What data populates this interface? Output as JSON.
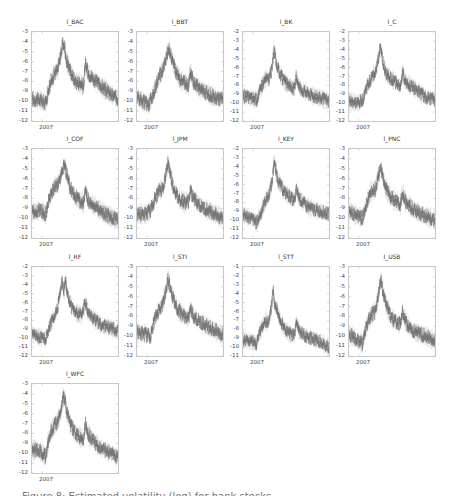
{
  "figure": {
    "caption": "Figure 8: Estimated volatility (log) for bank stocks"
  },
  "chart_data": [
    {
      "type": "line",
      "title": "l_BAC",
      "xlabel": "",
      "ylabel": "",
      "x_tick_labels": [
        "2007"
      ],
      "yticks": [
        -3,
        -4,
        -5,
        -6,
        -7,
        -8,
        -9,
        -10,
        -11,
        -12
      ],
      "ylim": [
        -12,
        -3
      ],
      "keypoints": [
        [
          0,
          -9.8
        ],
        [
          0.1,
          -9.9
        ],
        [
          0.16,
          -10.2
        ],
        [
          0.2,
          -8.5
        ],
        [
          0.26,
          -7.2
        ],
        [
          0.3,
          -6.8
        ],
        [
          0.34,
          -5
        ],
        [
          0.36,
          -4.1
        ],
        [
          0.38,
          -4.6
        ],
        [
          0.4,
          -5.8
        ],
        [
          0.44,
          -6.8
        ],
        [
          0.5,
          -8
        ],
        [
          0.56,
          -8.2
        ],
        [
          0.6,
          -8.5
        ],
        [
          0.62,
          -6.3
        ],
        [
          0.66,
          -7.2
        ],
        [
          0.74,
          -8
        ],
        [
          0.82,
          -8.6
        ],
        [
          0.9,
          -9.2
        ],
        [
          1,
          -9.8
        ]
      ]
    },
    {
      "type": "line",
      "title": "l_BBT",
      "xlabel": "",
      "ylabel": "",
      "x_tick_labels": [
        "2007"
      ],
      "yticks": [
        -3,
        -4,
        -5,
        -6,
        -7,
        -8,
        -9,
        -10,
        -11,
        -12
      ],
      "ylim": [
        -12,
        -3
      ],
      "keypoints": [
        [
          0,
          -9.6
        ],
        [
          0.1,
          -10.2
        ],
        [
          0.14,
          -10.3
        ],
        [
          0.2,
          -9
        ],
        [
          0.26,
          -7.5
        ],
        [
          0.3,
          -6.8
        ],
        [
          0.34,
          -5.5
        ],
        [
          0.37,
          -4.6
        ],
        [
          0.4,
          -5.5
        ],
        [
          0.44,
          -6.8
        ],
        [
          0.5,
          -7.8
        ],
        [
          0.56,
          -8.2
        ],
        [
          0.6,
          -8.4
        ],
        [
          0.62,
          -7
        ],
        [
          0.66,
          -8.2
        ],
        [
          0.74,
          -8.8
        ],
        [
          0.82,
          -9.2
        ],
        [
          0.9,
          -9.6
        ],
        [
          1,
          -9.9
        ]
      ]
    },
    {
      "type": "line",
      "title": "l_BK",
      "xlabel": "",
      "ylabel": "",
      "x_tick_labels": [
        "2007"
      ],
      "yticks": [
        -2,
        -3,
        -4,
        -5,
        -6,
        -7,
        -8,
        -9,
        -10,
        -11,
        -12
      ],
      "ylim": [
        -12,
        -2
      ],
      "keypoints": [
        [
          0,
          -9.2
        ],
        [
          0.1,
          -9.4
        ],
        [
          0.16,
          -9.6
        ],
        [
          0.2,
          -8.5
        ],
        [
          0.26,
          -7.2
        ],
        [
          0.3,
          -7.3
        ],
        [
          0.34,
          -6
        ],
        [
          0.36,
          -3.8
        ],
        [
          0.38,
          -5.2
        ],
        [
          0.42,
          -6.5
        ],
        [
          0.48,
          -7.6
        ],
        [
          0.56,
          -8.2
        ],
        [
          0.6,
          -8.4
        ],
        [
          0.62,
          -7
        ],
        [
          0.66,
          -8.3
        ],
        [
          0.74,
          -8.8
        ],
        [
          0.82,
          -9.2
        ],
        [
          0.9,
          -9.4
        ],
        [
          1,
          -9.8
        ]
      ]
    },
    {
      "type": "line",
      "title": "l_C",
      "xlabel": "",
      "ylabel": "",
      "x_tick_labels": [
        "2007"
      ],
      "yticks": [
        -2,
        -3,
        -4,
        -5,
        -6,
        -7,
        -8,
        -9,
        -10,
        -11,
        -12
      ],
      "ylim": [
        -12,
        -2
      ],
      "keypoints": [
        [
          0,
          -9.8
        ],
        [
          0.1,
          -10
        ],
        [
          0.16,
          -9.6
        ],
        [
          0.2,
          -8.3
        ],
        [
          0.26,
          -7.2
        ],
        [
          0.3,
          -6.6
        ],
        [
          0.34,
          -5.2
        ],
        [
          0.36,
          -3.8
        ],
        [
          0.39,
          -5
        ],
        [
          0.42,
          -6.5
        ],
        [
          0.48,
          -7.2
        ],
        [
          0.56,
          -7.8
        ],
        [
          0.6,
          -8.2
        ],
        [
          0.62,
          -6.6
        ],
        [
          0.66,
          -7.6
        ],
        [
          0.74,
          -8.2
        ],
        [
          0.82,
          -8.8
        ],
        [
          0.9,
          -9.4
        ],
        [
          1,
          -9.6
        ]
      ]
    },
    {
      "type": "line",
      "title": "l_COF",
      "xlabel": "",
      "ylabel": "",
      "x_tick_labels": [
        "2007"
      ],
      "yticks": [
        -3,
        -4,
        -5,
        -6,
        -7,
        -8,
        -9,
        -10,
        -11,
        -12
      ],
      "ylim": [
        -12,
        -3
      ],
      "keypoints": [
        [
          0,
          -9.4
        ],
        [
          0.1,
          -9.2
        ],
        [
          0.16,
          -9.6
        ],
        [
          0.2,
          -8
        ],
        [
          0.26,
          -6.8
        ],
        [
          0.3,
          -6.6
        ],
        [
          0.34,
          -5.5
        ],
        [
          0.37,
          -4.6
        ],
        [
          0.4,
          -5.4
        ],
        [
          0.44,
          -6.8
        ],
        [
          0.5,
          -7.8
        ],
        [
          0.56,
          -8.3
        ],
        [
          0.6,
          -8.5
        ],
        [
          0.62,
          -7.2
        ],
        [
          0.66,
          -8.3
        ],
        [
          0.74,
          -8.8
        ],
        [
          0.82,
          -9.4
        ],
        [
          0.9,
          -9.8
        ],
        [
          1,
          -10.2
        ]
      ]
    },
    {
      "type": "line",
      "title": "l_JPM",
      "xlabel": "",
      "ylabel": "",
      "x_tick_labels": [
        "2007"
      ],
      "yticks": [
        -3,
        -4,
        -5,
        -6,
        -7,
        -8,
        -9,
        -10,
        -11,
        -12
      ],
      "ylim": [
        -12,
        -3
      ],
      "keypoints": [
        [
          0,
          -9.6
        ],
        [
          0.1,
          -9.6
        ],
        [
          0.16,
          -9.2
        ],
        [
          0.2,
          -8.2
        ],
        [
          0.26,
          -7.2
        ],
        [
          0.3,
          -7
        ],
        [
          0.34,
          -5.5
        ],
        [
          0.36,
          -4.3
        ],
        [
          0.39,
          -5.6
        ],
        [
          0.42,
          -6.8
        ],
        [
          0.48,
          -8
        ],
        [
          0.56,
          -8.4
        ],
        [
          0.6,
          -8.3
        ],
        [
          0.62,
          -7.2
        ],
        [
          0.66,
          -8
        ],
        [
          0.74,
          -8.8
        ],
        [
          0.82,
          -9.2
        ],
        [
          0.9,
          -9.5
        ],
        [
          1,
          -10
        ]
      ]
    },
    {
      "type": "line",
      "title": "l_KEY",
      "xlabel": "",
      "ylabel": "",
      "x_tick_labels": [
        "2007"
      ],
      "yticks": [
        -2,
        -3,
        -4,
        -5,
        -6,
        -7,
        -8,
        -9,
        -10,
        -11,
        -12
      ],
      "ylim": [
        -12,
        -2
      ],
      "keypoints": [
        [
          0,
          -9.4
        ],
        [
          0.1,
          -9.8
        ],
        [
          0.16,
          -10.3
        ],
        [
          0.2,
          -9.4
        ],
        [
          0.26,
          -7.8
        ],
        [
          0.3,
          -7.2
        ],
        [
          0.34,
          -5.6
        ],
        [
          0.36,
          -3.4
        ],
        [
          0.39,
          -4.8
        ],
        [
          0.42,
          -5.8
        ],
        [
          0.48,
          -6.8
        ],
        [
          0.56,
          -7.5
        ],
        [
          0.6,
          -7.9
        ],
        [
          0.62,
          -6.6
        ],
        [
          0.66,
          -7.6
        ],
        [
          0.74,
          -8.4
        ],
        [
          0.82,
          -8.8
        ],
        [
          0.9,
          -9
        ],
        [
          1,
          -9.3
        ]
      ]
    },
    {
      "type": "line",
      "title": "l_PNC",
      "xlabel": "",
      "ylabel": "",
      "x_tick_labels": [
        "2007"
      ],
      "yticks": [
        -3,
        -4,
        -5,
        -6,
        -7,
        -8,
        -9,
        -10,
        -11,
        -12
      ],
      "ylim": [
        -12,
        -3
      ],
      "keypoints": [
        [
          0,
          -9.2
        ],
        [
          0.1,
          -9.8
        ],
        [
          0.16,
          -10
        ],
        [
          0.2,
          -8.6
        ],
        [
          0.26,
          -7.2
        ],
        [
          0.3,
          -7.2
        ],
        [
          0.34,
          -5.8
        ],
        [
          0.37,
          -4.9
        ],
        [
          0.4,
          -6
        ],
        [
          0.44,
          -7.2
        ],
        [
          0.5,
          -8
        ],
        [
          0.56,
          -8.4
        ],
        [
          0.6,
          -8.6
        ],
        [
          0.62,
          -7.3
        ],
        [
          0.66,
          -8.4
        ],
        [
          0.74,
          -9
        ],
        [
          0.82,
          -9.5
        ],
        [
          0.9,
          -9.8
        ],
        [
          1,
          -10.2
        ]
      ]
    },
    {
      "type": "line",
      "title": "l_RF",
      "xlabel": "",
      "ylabel": "",
      "x_tick_labels": [
        "2007"
      ],
      "yticks": [
        -2,
        -3,
        -4,
        -5,
        -6,
        -7,
        -8,
        -9,
        -10,
        -11,
        -12
      ],
      "ylim": [
        -12,
        -2
      ],
      "keypoints": [
        [
          0,
          -9.6
        ],
        [
          0.1,
          -9.9
        ],
        [
          0.16,
          -10
        ],
        [
          0.2,
          -8.8
        ],
        [
          0.26,
          -7.4
        ],
        [
          0.3,
          -6.6
        ],
        [
          0.33,
          -4.6
        ],
        [
          0.35,
          -3.6
        ],
        [
          0.37,
          -4.8
        ],
        [
          0.39,
          -3.6
        ],
        [
          0.42,
          -5.4
        ],
        [
          0.46,
          -6.5
        ],
        [
          0.52,
          -7.2
        ],
        [
          0.58,
          -7.4
        ],
        [
          0.62,
          -6
        ],
        [
          0.66,
          -7.2
        ],
        [
          0.74,
          -8
        ],
        [
          0.82,
          -8.6
        ],
        [
          0.9,
          -8.8
        ],
        [
          1,
          -9.2
        ]
      ]
    },
    {
      "type": "line",
      "title": "l_STI",
      "xlabel": "",
      "ylabel": "",
      "x_tick_labels": [
        "2007"
      ],
      "yticks": [
        -3,
        -4,
        -5,
        -6,
        -7,
        -8,
        -9,
        -10,
        -11,
        -12
      ],
      "ylim": [
        -12,
        -3
      ],
      "keypoints": [
        [
          0,
          -9.6
        ],
        [
          0.1,
          -9.8
        ],
        [
          0.16,
          -10
        ],
        [
          0.2,
          -8.4
        ],
        [
          0.26,
          -7.2
        ],
        [
          0.3,
          -6.8
        ],
        [
          0.34,
          -5.2
        ],
        [
          0.36,
          -4.2
        ],
        [
          0.39,
          -5
        ],
        [
          0.42,
          -6.2
        ],
        [
          0.48,
          -7.4
        ],
        [
          0.56,
          -8
        ],
        [
          0.6,
          -8.3
        ],
        [
          0.62,
          -7.2
        ],
        [
          0.66,
          -8
        ],
        [
          0.74,
          -8.6
        ],
        [
          0.82,
          -9
        ],
        [
          0.9,
          -9.4
        ],
        [
          1,
          -9.9
        ]
      ]
    },
    {
      "type": "line",
      "title": "l_STT",
      "xlabel": "",
      "ylabel": "",
      "x_tick_labels": [
        "2007"
      ],
      "yticks": [
        -1,
        -2,
        -3,
        -4,
        -5,
        -6,
        -7,
        -8,
        -9,
        -10,
        -11
      ],
      "ylim": [
        -11,
        -1
      ],
      "keypoints": [
        [
          0,
          -9.2
        ],
        [
          0.1,
          -9.4
        ],
        [
          0.16,
          -9.6
        ],
        [
          0.2,
          -8.2
        ],
        [
          0.26,
          -7
        ],
        [
          0.3,
          -7.3
        ],
        [
          0.33,
          -5.6
        ],
        [
          0.35,
          -3.4
        ],
        [
          0.37,
          -5.4
        ],
        [
          0.4,
          -5.8
        ],
        [
          0.44,
          -7.2
        ],
        [
          0.5,
          -8.2
        ],
        [
          0.56,
          -8.6
        ],
        [
          0.6,
          -8.6
        ],
        [
          0.62,
          -7.3
        ],
        [
          0.66,
          -8.3
        ],
        [
          0.74,
          -8.8
        ],
        [
          0.82,
          -9.1
        ],
        [
          0.9,
          -9.4
        ],
        [
          1,
          -10.1
        ]
      ]
    },
    {
      "type": "line",
      "title": "l_USB",
      "xlabel": "",
      "ylabel": "",
      "x_tick_labels": [
        "2007"
      ],
      "yticks": [
        -3,
        -4,
        -5,
        -6,
        -7,
        -8,
        -9,
        -10,
        -11,
        -12
      ],
      "ylim": [
        -12,
        -3
      ],
      "keypoints": [
        [
          0,
          -9.8
        ],
        [
          0.1,
          -10.4
        ],
        [
          0.16,
          -10.8
        ],
        [
          0.2,
          -9
        ],
        [
          0.26,
          -7.8
        ],
        [
          0.3,
          -7.6
        ],
        [
          0.34,
          -6
        ],
        [
          0.37,
          -4.2
        ],
        [
          0.4,
          -5.6
        ],
        [
          0.44,
          -7
        ],
        [
          0.5,
          -8.2
        ],
        [
          0.56,
          -8.6
        ],
        [
          0.6,
          -8.8
        ],
        [
          0.62,
          -7.4
        ],
        [
          0.66,
          -8.6
        ],
        [
          0.74,
          -9.4
        ],
        [
          0.82,
          -9.8
        ],
        [
          0.9,
          -10
        ],
        [
          1,
          -10.6
        ]
      ]
    },
    {
      "type": "line",
      "title": "l_WFC",
      "xlabel": "",
      "ylabel": "",
      "x_tick_labels": [
        "2007"
      ],
      "yticks": [
        -3,
        -4,
        -5,
        -6,
        -7,
        -8,
        -9,
        -10,
        -11,
        -12
      ],
      "ylim": [
        -12,
        -3
      ],
      "keypoints": [
        [
          0,
          -9.6
        ],
        [
          0.1,
          -9.8
        ],
        [
          0.16,
          -10.4
        ],
        [
          0.2,
          -8.2
        ],
        [
          0.26,
          -7.2
        ],
        [
          0.3,
          -6.8
        ],
        [
          0.34,
          -5.4
        ],
        [
          0.36,
          -4.4
        ],
        [
          0.38,
          -4.4
        ],
        [
          0.4,
          -5.6
        ],
        [
          0.44,
          -7
        ],
        [
          0.5,
          -8
        ],
        [
          0.56,
          -8.4
        ],
        [
          0.6,
          -8.6
        ],
        [
          0.62,
          -7
        ],
        [
          0.66,
          -8.2
        ],
        [
          0.74,
          -9
        ],
        [
          0.82,
          -9.6
        ],
        [
          0.9,
          -9.9
        ],
        [
          1,
          -10.4
        ]
      ]
    }
  ],
  "style": {
    "trace_color": "#707070",
    "band_color": "#d0d0d0",
    "frame_color": "#c8c8c8"
  }
}
